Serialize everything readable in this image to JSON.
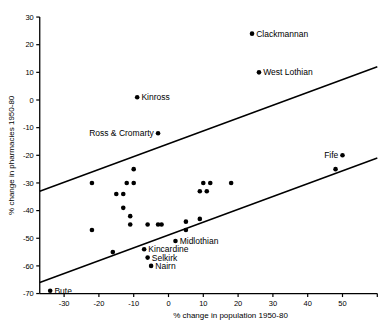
{
  "chart_data": {
    "type": "scatter",
    "title": "",
    "xlabel": "% change in population 1950-80",
    "ylabel": "% change in pharmacies 1950-80",
    "xlim": [
      -37,
      60
    ],
    "ylim": [
      -70,
      30
    ],
    "xticks": [
      -30,
      -20,
      -10,
      0,
      10,
      20,
      30,
      40,
      50
    ],
    "yticks": [
      30,
      20,
      10,
      0,
      -10,
      -20,
      -30,
      -40,
      -50,
      -60,
      -70
    ],
    "grid": false,
    "legend": "none",
    "points": [
      {
        "label": "Clackmannan",
        "x": 24,
        "y": 24,
        "labelpos": "right"
      },
      {
        "label": "West Lothian",
        "x": 26,
        "y": 10,
        "labelpos": "right"
      },
      {
        "label": "Kinross",
        "x": -9,
        "y": 1,
        "labelpos": "right"
      },
      {
        "label": "Ross & Cromarty",
        "x": -3,
        "y": -12,
        "labelpos": "left"
      },
      {
        "label": "Fife",
        "x": 50,
        "y": -20,
        "labelpos": "left"
      },
      {
        "label": "Midlothian",
        "x": 2,
        "y": -51,
        "labelpos": "right"
      },
      {
        "label": "Kincardine",
        "x": -7,
        "y": -54,
        "labelpos": "right"
      },
      {
        "label": "Selkirk",
        "x": -6,
        "y": -57,
        "labelpos": "right"
      },
      {
        "label": "Nairn",
        "x": -5,
        "y": -60,
        "labelpos": "right"
      },
      {
        "label": "Bute",
        "x": -34,
        "y": -69,
        "labelpos": "right"
      },
      {
        "label": "",
        "x": -10,
        "y": -25
      },
      {
        "label": "",
        "x": -22,
        "y": -30
      },
      {
        "label": "",
        "x": -12,
        "y": -30
      },
      {
        "label": "",
        "x": -10,
        "y": -30
      },
      {
        "label": "",
        "x": -15,
        "y": -34
      },
      {
        "label": "",
        "x": -13,
        "y": -34
      },
      {
        "label": "",
        "x": -13,
        "y": -39
      },
      {
        "label": "",
        "x": -11,
        "y": -42
      },
      {
        "label": "",
        "x": -11,
        "y": -45
      },
      {
        "label": "",
        "x": -22,
        "y": -47
      },
      {
        "label": "",
        "x": -6,
        "y": -45
      },
      {
        "label": "",
        "x": -3,
        "y": -45
      },
      {
        "label": "",
        "x": -2,
        "y": -45
      },
      {
        "label": "",
        "x": 5,
        "y": -44
      },
      {
        "label": "",
        "x": 10,
        "y": -30
      },
      {
        "label": "",
        "x": 12,
        "y": -30
      },
      {
        "label": "",
        "x": 18,
        "y": -30
      },
      {
        "label": "",
        "x": 9,
        "y": -33
      },
      {
        "label": "",
        "x": 11,
        "y": -33
      },
      {
        "label": "",
        "x": 9,
        "y": -43
      },
      {
        "label": "",
        "x": 5,
        "y": -47
      },
      {
        "label": "",
        "x": -16,
        "y": -55
      },
      {
        "label": "",
        "x": 48,
        "y": -25
      }
    ],
    "reference_lines": [
      {
        "name": "upper-boundary-line",
        "x1": -37,
        "y1": -33,
        "x2": 60,
        "y2": 12
      },
      {
        "name": "lower-boundary-line",
        "x1": -37,
        "y1": -66,
        "x2": 60,
        "y2": -21
      }
    ]
  },
  "axis": {
    "y_title": "% change in pharmacies 1950-80",
    "x_title": "% change in population 1950-80",
    "y_tick_labels": [
      "30",
      "20",
      "10",
      "0",
      "-10",
      "-20",
      "-30",
      "-40",
      "-50",
      "-60",
      "-70"
    ],
    "x_tick_labels": [
      "-30",
      "-20",
      "-10",
      "0",
      "10",
      "20",
      "30",
      "40",
      "50"
    ]
  },
  "colors": {
    "axis": "#000000",
    "point": "#000000",
    "background": "#ffffff"
  }
}
